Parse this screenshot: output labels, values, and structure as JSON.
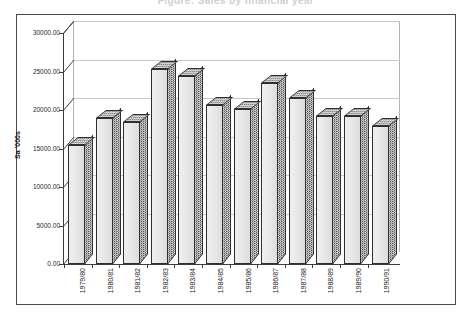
{
  "title_faint": "Figure: Sales by financial year",
  "chart_data": {
    "type": "bar",
    "title": "",
    "xlabel": "",
    "ylabel": "Sa '000s",
    "categories": [
      "1979/80",
      "1980/81",
      "1981/82",
      "1982/83",
      "1983/84",
      "1984/85",
      "1985/86",
      "1986/87",
      "1987/88",
      "1988/89",
      "1989/90",
      "1990/91"
    ],
    "values": [
      15400,
      18900,
      18500,
      25300,
      24400,
      20700,
      20100,
      23500,
      21500,
      19200,
      19200,
      17900
    ],
    "ylim": [
      0,
      30000
    ],
    "ytick_step": 5000,
    "ytick_labels": [
      "30000.00",
      "25000.00",
      "20000.00",
      "15000.00",
      "10000.00",
      "5000.00",
      "0.00"
    ],
    "ytick_values": [
      30000,
      25000,
      20000,
      15000,
      10000,
      5000,
      0
    ],
    "grid": true,
    "legend": "none",
    "style_3d": true,
    "bar_face_color": "#e9e9e9",
    "bar_side_color": "#5a5a5a",
    "bar_top_color": "#8d8d8d",
    "gridline_color": "#c8c8c8",
    "axis_color": "#3c3c3c",
    "background_color": "#ffffff"
  }
}
